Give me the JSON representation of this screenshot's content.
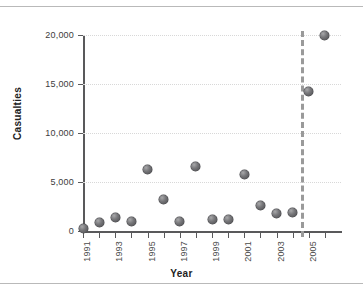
{
  "chart_data": {
    "type": "scatter",
    "title": "",
    "xlabel": "Year",
    "ylabel": "Casualties",
    "xlim": [
      1990.5,
      2006.5
    ],
    "ylim": [
      0,
      20000
    ],
    "grid": true,
    "legend": null,
    "y_ticks": [
      {
        "value": 20000,
        "label": "20,000"
      },
      {
        "value": 15000,
        "label": "15,000"
      },
      {
        "value": 10000,
        "label": "10,000"
      },
      {
        "value": 5000,
        "label": "5,000"
      },
      {
        "value": 0,
        "label": "0"
      }
    ],
    "x_ticks": [
      {
        "value": 1991,
        "label": "1991"
      },
      {
        "value": 1992,
        "label": ""
      },
      {
        "value": 1993,
        "label": "1993"
      },
      {
        "value": 1994,
        "label": ""
      },
      {
        "value": 1995,
        "label": "1995"
      },
      {
        "value": 1996,
        "label": ""
      },
      {
        "value": 1997,
        "label": "1997"
      },
      {
        "value": 1998,
        "label": ""
      },
      {
        "value": 1999,
        "label": "1999"
      },
      {
        "value": 2000,
        "label": ""
      },
      {
        "value": 2001,
        "label": "2001"
      },
      {
        "value": 2002,
        "label": ""
      },
      {
        "value": 2003,
        "label": "2003"
      },
      {
        "value": 2004,
        "label": ""
      },
      {
        "value": 2005,
        "label": "2005"
      },
      {
        "value": 2006,
        "label": ""
      }
    ],
    "x": [
      1991,
      1992,
      1993,
      1994,
      1995,
      1996,
      1997,
      1998,
      1999,
      2000,
      2001,
      2002,
      2003,
      2004,
      2005,
      2006
    ],
    "values": [
      300,
      900,
      1400,
      1000,
      6300,
      3200,
      1000,
      6600,
      1150,
      1150,
      5800,
      2600,
      1800,
      1850,
      14200,
      20000
    ],
    "annotations": [
      {
        "type": "vline",
        "x": 2004.55,
        "style": "dashed",
        "color": "#9a9a9a"
      }
    ],
    "marker_color": "#6e6e70",
    "gridline_color": "#d8d8d8",
    "axis_color": "#59595b"
  }
}
